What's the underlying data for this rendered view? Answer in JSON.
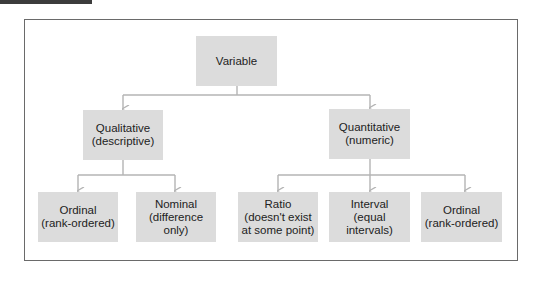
{
  "diagram": {
    "root": {
      "label": "Variable"
    },
    "level1": [
      {
        "label": "Qualitative\n(descriptive)"
      },
      {
        "label": "Quantitative\n(numeric)"
      }
    ],
    "qualitative_children": [
      {
        "label": "Ordinal\n(rank-ordered)"
      },
      {
        "label": "Nominal\n(difference\nonly)"
      }
    ],
    "quantitative_children": [
      {
        "label": "Ratio\n(doesn't exist\nat some point)"
      },
      {
        "label": "Interval\n(equal\nintervals)"
      },
      {
        "label": "Ordinal\n(rank-ordered)"
      }
    ]
  },
  "colors": {
    "node_fill": "#dcdcdc",
    "connector": "#b4b4b4",
    "frame": "#6a6a6a",
    "tab": "#3c3c3c"
  }
}
